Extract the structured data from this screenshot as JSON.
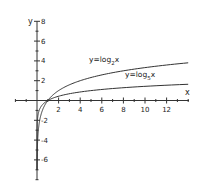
{
  "chart_data": {
    "type": "line",
    "title": "",
    "xlabel": "x",
    "ylabel": "y",
    "xlim": [
      -2,
      14
    ],
    "ylim": [
      -8,
      8
    ],
    "grid": false,
    "x_ticks": [
      2,
      4,
      6,
      8,
      10,
      12
    ],
    "x_tick_labels": [
      "2",
      "4",
      "6",
      "8",
      "10",
      "12"
    ],
    "y_ticks": [
      8,
      6,
      4,
      2,
      -2,
      -4,
      -6
    ],
    "y_tick_labels": [
      "8",
      "6",
      "4",
      "2",
      "-2",
      "-4",
      "-6"
    ],
    "series": [
      {
        "name": "y=log2x",
        "label_main": "y=log",
        "label_sub": "2",
        "label_tail": "x",
        "x": [
          0.008,
          0.02,
          0.05,
          0.1,
          0.2,
          0.35,
          0.5,
          0.75,
          1,
          1.5,
          2,
          3,
          4,
          6,
          8,
          10,
          12,
          14
        ],
        "values": [
          -6.97,
          -5.64,
          -4.32,
          -3.32,
          -2.32,
          -1.51,
          -1.0,
          -0.42,
          0,
          0.58,
          1.0,
          1.58,
          2.0,
          2.58,
          3.0,
          3.32,
          3.58,
          3.81
        ]
      },
      {
        "name": "y=log5x",
        "label_main": "y=log",
        "label_sub": "5",
        "label_tail": "x",
        "x": [
          0.0004,
          0.002,
          0.01,
          0.05,
          0.1,
          0.2,
          0.35,
          0.5,
          0.75,
          1,
          1.5,
          2,
          3,
          4,
          6,
          8,
          10,
          12,
          14
        ],
        "values": [
          -4.86,
          -3.86,
          -2.86,
          -1.86,
          -1.43,
          -1.0,
          -0.65,
          -0.43,
          -0.18,
          0,
          0.25,
          0.43,
          0.68,
          0.86,
          1.11,
          1.29,
          1.43,
          1.54,
          1.64
        ]
      }
    ],
    "annotations": [
      {
        "text": "y=log2x",
        "near": [
          6,
          4
        ]
      },
      {
        "text": "y=log5x",
        "near": [
          10,
          2.3
        ]
      }
    ],
    "legend": "none (inline curve labels)"
  },
  "axes": {
    "x_label": "x",
    "y_label": "y",
    "y_top_label": "8"
  }
}
